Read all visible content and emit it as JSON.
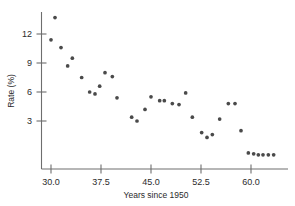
{
  "chart_data": {
    "type": "scatter",
    "title": "",
    "xlabel": "Years since 1950",
    "ylabel": "Rate (%)",
    "xlim": [
      28.2,
      64.5
    ],
    "ylim": [
      -2.0,
      14.5
    ],
    "xticks": [
      30.0,
      37.5,
      45.0,
      52.5,
      60.0
    ],
    "xticklabels": [
      "30.0",
      "37.5",
      "45.0",
      "52.5",
      "60.0"
    ],
    "yticks": [
      3,
      6,
      9,
      12
    ],
    "yticklabels": [
      "3",
      "6",
      "9",
      "12"
    ],
    "grid": false,
    "legend": null,
    "marker_color": "#4a4a4a",
    "points": [
      {
        "x": 30.0,
        "y": 11.4
      },
      {
        "x": 30.6,
        "y": 13.7
      },
      {
        "x": 31.5,
        "y": 10.6
      },
      {
        "x": 32.5,
        "y": 8.7
      },
      {
        "x": 33.2,
        "y": 9.5
      },
      {
        "x": 34.6,
        "y": 7.5
      },
      {
        "x": 35.8,
        "y": 6.0
      },
      {
        "x": 36.6,
        "y": 5.8
      },
      {
        "x": 37.3,
        "y": 6.6
      },
      {
        "x": 38.1,
        "y": 8.0
      },
      {
        "x": 39.2,
        "y": 7.6
      },
      {
        "x": 39.9,
        "y": 5.4
      },
      {
        "x": 42.1,
        "y": 3.4
      },
      {
        "x": 42.9,
        "y": 3.0
      },
      {
        "x": 44.1,
        "y": 4.2
      },
      {
        "x": 45.0,
        "y": 5.5
      },
      {
        "x": 46.3,
        "y": 5.1
      },
      {
        "x": 47.0,
        "y": 5.1
      },
      {
        "x": 48.2,
        "y": 4.8
      },
      {
        "x": 49.2,
        "y": 4.7
      },
      {
        "x": 50.2,
        "y": 5.9
      },
      {
        "x": 51.2,
        "y": 3.4
      },
      {
        "x": 52.6,
        "y": 1.8
      },
      {
        "x": 53.4,
        "y": 1.3
      },
      {
        "x": 54.2,
        "y": 1.6
      },
      {
        "x": 55.3,
        "y": 3.2
      },
      {
        "x": 56.6,
        "y": 4.8
      },
      {
        "x": 57.6,
        "y": 4.8
      },
      {
        "x": 58.5,
        "y": 2.0
      },
      {
        "x": 59.6,
        "y": -0.3
      },
      {
        "x": 60.4,
        "y": -0.4
      },
      {
        "x": 61.1,
        "y": -0.5
      },
      {
        "x": 61.8,
        "y": -0.5
      },
      {
        "x": 62.6,
        "y": -0.5
      },
      {
        "x": 63.4,
        "y": -0.5
      }
    ]
  }
}
